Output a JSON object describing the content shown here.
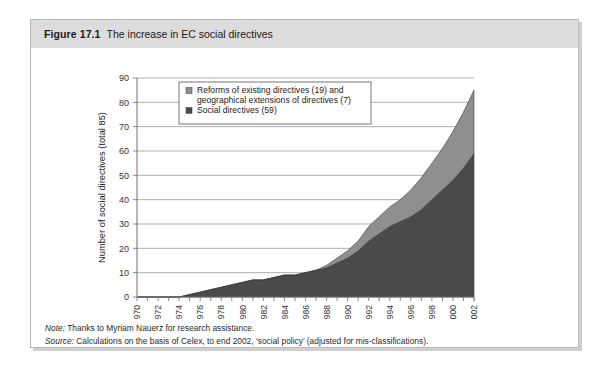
{
  "figure": {
    "number": "Figure 17.1",
    "title": "The increase in EC social directives"
  },
  "notes": {
    "note_label": "Note:",
    "note_text": " Thanks to Myriam Nauerz for research assistance.",
    "source_label": "Source:",
    "source_text": " Calculations on the basis of Celex, to end 2002, ‘social policy’ (adjusted for mis-classifications)."
  },
  "colors": {
    "dark_series": "#4a4a4a",
    "light_series": "#8f8f8f",
    "caption_bar": "#dcdcdc",
    "frame_border": "#b9b9b9",
    "gridline": "#8c8c8c"
  },
  "chart_data": {
    "type": "area",
    "stacked": true,
    "title": "The increase in EC social directives",
    "xlabel": "",
    "ylabel": "Number of social directives (total 85)",
    "ylim": [
      0,
      90
    ],
    "ytick_step": 10,
    "yticks": [
      0,
      10,
      20,
      30,
      40,
      50,
      60,
      70,
      80,
      90
    ],
    "grid": true,
    "legend_position": "top-left-inside",
    "x": [
      1970,
      1971,
      1972,
      1973,
      1974,
      1975,
      1976,
      1977,
      1978,
      1979,
      1980,
      1981,
      1982,
      1983,
      1984,
      1985,
      1986,
      1987,
      1988,
      1989,
      1990,
      1991,
      1992,
      1993,
      1994,
      1995,
      1996,
      1997,
      1998,
      1999,
      2000,
      2001,
      2002
    ],
    "xtick_labels": [
      "1970",
      "1972",
      "1974",
      "1976",
      "1978",
      "1980",
      "1982",
      "1984",
      "1986",
      "1988",
      "1990",
      "1992",
      "1994",
      "1996",
      "1998",
      "2000",
      "2002"
    ],
    "series": [
      {
        "name": "Social directives (59)",
        "color": "#4a4a4a",
        "count": 59,
        "values": [
          0,
          0,
          0,
          0,
          0,
          1,
          2,
          3,
          4,
          5,
          6,
          7,
          7,
          8,
          9,
          9,
          10,
          11,
          12,
          14,
          16,
          19,
          23,
          26,
          29,
          31,
          33,
          36,
          40,
          44,
          48,
          53,
          59
        ]
      },
      {
        "name": "Reforms of existing directives (19) and geographical extensions of directives (7)",
        "color": "#8f8f8f",
        "count_reforms": 19,
        "count_extensions": 7,
        "values": [
          0,
          0,
          0,
          0,
          0,
          0,
          0,
          0,
          0,
          0,
          0,
          0,
          0,
          0,
          0,
          0,
          0,
          0,
          1,
          2,
          3,
          4,
          6,
          7,
          8,
          9,
          11,
          13,
          15,
          17,
          20,
          23,
          26
        ]
      }
    ],
    "totals": [
      0,
      0,
      0,
      0,
      0,
      1,
      2,
      3,
      4,
      5,
      6,
      7,
      7,
      8,
      9,
      9,
      10,
      11,
      13,
      16,
      19,
      23,
      29,
      33,
      37,
      40,
      44,
      49,
      55,
      61,
      68,
      76,
      85
    ],
    "legend": [
      {
        "line1": "Reforms of existing directives (19) and",
        "line2": "geographical extensions of directives (7)",
        "color": "#8f8f8f"
      },
      {
        "line1": "Social directives (59)",
        "line2": "",
        "color": "#4a4a4a"
      }
    ]
  }
}
